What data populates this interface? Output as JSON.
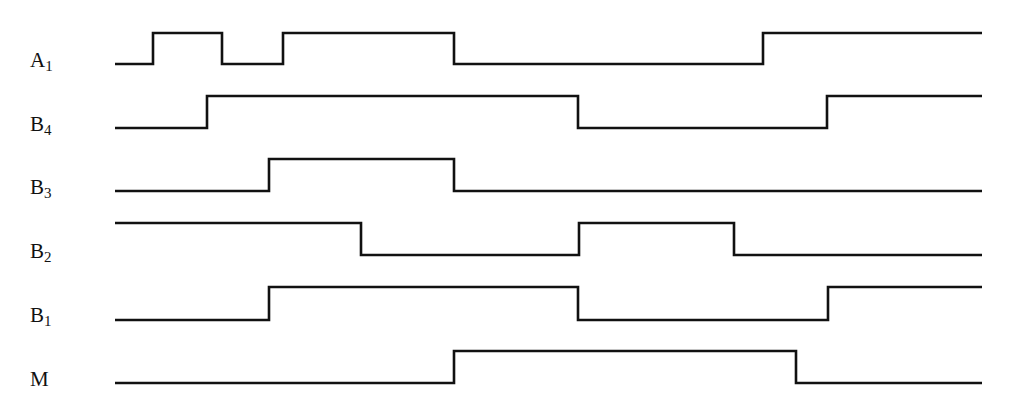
{
  "diagram": {
    "type": "timing-diagram",
    "x_start": 115,
    "x_end": 982,
    "signals": [
      {
        "name": "A",
        "sub": "1",
        "label_y": 50,
        "low_y": 64,
        "high_y": 33,
        "initial": 0,
        "transitions": [
          153,
          222,
          283,
          454,
          763
        ]
      },
      {
        "name": "B",
        "sub": "4",
        "label_y": 114,
        "low_y": 128,
        "high_y": 96,
        "initial": 0,
        "transitions": [
          207,
          578,
          827
        ]
      },
      {
        "name": "B",
        "sub": "3",
        "label_y": 177,
        "low_y": 191,
        "high_y": 159,
        "initial": 0,
        "transitions": [
          269,
          454
        ]
      },
      {
        "name": "B",
        "sub": "2",
        "label_y": 241,
        "low_y": 255,
        "high_y": 223,
        "initial": 1,
        "transitions": [
          361,
          579,
          734
        ]
      },
      {
        "name": "B",
        "sub": "1",
        "label_y": 305,
        "low_y": 320,
        "high_y": 287,
        "initial": 0,
        "transitions": [
          269,
          578,
          828
        ]
      },
      {
        "name": "M",
        "sub": "",
        "label_y": 369,
        "low_y": 383,
        "high_y": 351,
        "initial": 0,
        "transitions": [
          454,
          796
        ]
      }
    ]
  },
  "colors": {
    "line": "#111111",
    "background": "#ffffff"
  }
}
